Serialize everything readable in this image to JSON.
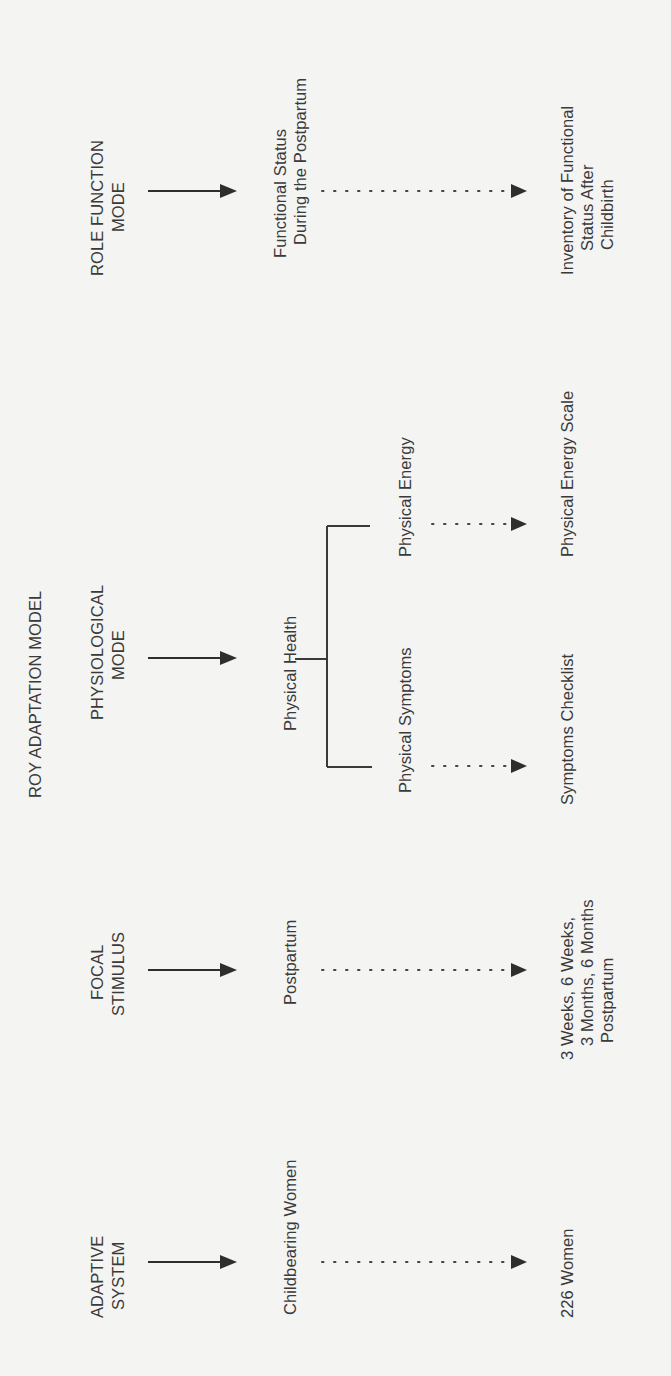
{
  "title": "ROY ADAPTATION MODEL",
  "columns": [
    {
      "concept": [
        "ADAPTIVE",
        "SYSTEM"
      ],
      "construct": [
        "Childbearing Women"
      ],
      "measure": [
        "226 Women"
      ]
    },
    {
      "concept": [
        "FOCAL",
        "STIMULUS"
      ],
      "construct": [
        "Postpartum"
      ],
      "measure": [
        "3 Weeks, 6 Weeks,",
        "3 Months, 6 Months",
        "Postpartum"
      ]
    },
    {
      "concept": [
        "PHYSIOLOGICAL",
        "MODE"
      ],
      "construct": [
        "Physical Health"
      ],
      "subconstructs": [
        "Physical Symptoms",
        "Physical Energy"
      ],
      "measures": [
        "Symptoms Checklist",
        "Physical Energy Scale"
      ]
    },
    {
      "concept": [
        "ROLE FUNCTION",
        "MODE"
      ],
      "construct": [
        "Functional Status",
        "During the Postpartum"
      ],
      "measure": [
        "Inventory of Functional",
        "Status After",
        "Childbirth"
      ]
    }
  ],
  "colors": {
    "background": "#f4f4f2",
    "ink": "#3a3a3a"
  }
}
